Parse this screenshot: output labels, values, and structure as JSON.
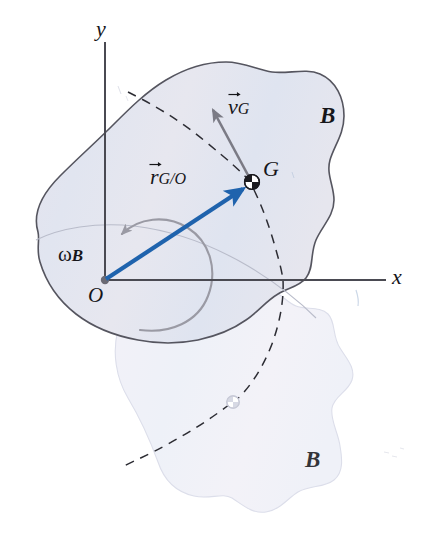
{
  "figure": {
    "background_color": "#ffffff"
  },
  "axes": {
    "x_label": "x",
    "y_label": "y",
    "origin_label": "O",
    "axis_color": "#4a4a52",
    "origin": {
      "x": 105,
      "y": 280
    },
    "x_end": {
      "x": 386,
      "y": 280
    },
    "y_end": {
      "x": 105,
      "y": 42
    }
  },
  "bodies": {
    "current": {
      "label": "B",
      "fill_color": "#e3e4ef",
      "stroke_color": "#53535c",
      "state": "current-position"
    },
    "ghost": {
      "label": "B",
      "fill_color": "#f0f1f8",
      "stroke_color": "#d6d8e6",
      "state": "later-position"
    }
  },
  "points": {
    "center_of_mass": {
      "label": "G",
      "x": 252,
      "y": 182,
      "marker": "quartered-circle"
    },
    "center_of_mass_ghost": {
      "label": "G",
      "x": 233,
      "y": 402,
      "marker": "quartered-circle-faded"
    },
    "origin": {
      "label": "O",
      "x": 105,
      "y": 280,
      "marker": "filled-dot"
    }
  },
  "vectors": {
    "position": {
      "symbol": "r",
      "subscript": "G/O",
      "full_label": "r⃗ G/O",
      "color": "#1f63ad",
      "from": {
        "x": 105,
        "y": 280
      },
      "to": {
        "x": 247,
        "y": 187
      },
      "description": "position vector of G relative to O"
    },
    "velocity": {
      "symbol": "v",
      "subscript": "G",
      "full_label": "v⃗ G",
      "color": "#7b7b85",
      "from": {
        "x": 250,
        "y": 178
      },
      "to": {
        "x": 210,
        "y": 104
      },
      "description": "velocity of the center of mass G"
    },
    "angular_velocity": {
      "symbol": "ω",
      "subscript": "B",
      "full_label": "ω B",
      "color": "#8f8f99",
      "sense": "counterclockwise",
      "description": "angular velocity of body B about O"
    }
  },
  "trajectory": {
    "style": "dashed",
    "color": "#2a2a30",
    "description": "circular path traced by G about O"
  },
  "icons": {
    "vector_arrow_accent": "vector-arrow-icon",
    "rotation_arc": "rotation-arc-icon"
  }
}
